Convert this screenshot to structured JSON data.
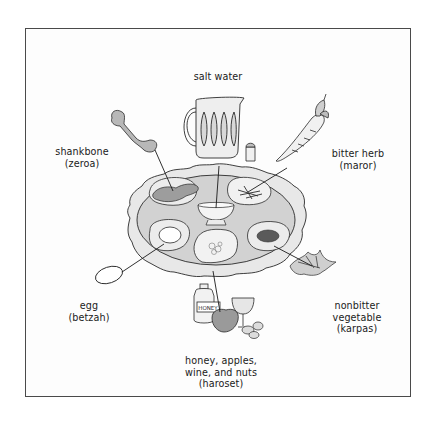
{
  "figure": {
    "colors": {
      "line": "#2a2a2a",
      "fill_light": "#e6e6e6",
      "fill_mid": "#cfcfcf",
      "fill_dark": "#9a9a9a",
      "frame": "#4a4a4a"
    }
  },
  "labels": {
    "salt_water": {
      "line1": "salt water"
    },
    "shankbone": {
      "line1": "shankbone",
      "line2": "(zeroa)"
    },
    "bitter_herb": {
      "line1": "bitter herb",
      "line2": "(maror)"
    },
    "egg": {
      "line1": "egg",
      "line2": "(betzah)"
    },
    "nonbitter_vegetable": {
      "line1": "nonbitter",
      "line2": "vegetable",
      "line3": "(karpas)"
    },
    "haroset": {
      "line1": "honey, apples,",
      "line2": "wine, and nuts",
      "line3": "(haroset)"
    }
  },
  "illustration_text": {
    "honey_jar_label": "HONEY"
  }
}
